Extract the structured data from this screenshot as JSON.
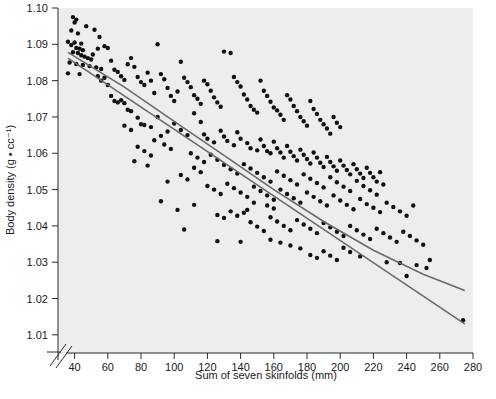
{
  "chart_data": {
    "type": "scatter",
    "title": "",
    "xlabel": "Sum of seven skinfolds (mm)",
    "ylabel": "Body density (g • cc⁻¹)",
    "xlim": [
      30,
      280
    ],
    "ylim": [
      1.005,
      1.1
    ],
    "xticks": [
      40,
      60,
      80,
      100,
      120,
      140,
      160,
      180,
      200,
      220,
      240,
      260,
      280
    ],
    "yticks": [
      1.01,
      1.02,
      1.03,
      1.04,
      1.05,
      1.06,
      1.07,
      1.08,
      1.09,
      1.1
    ],
    "ytick_labels": [
      "1.01",
      "1.02",
      "1.03",
      "1.04",
      "1.05",
      "1.06",
      "1.07",
      "1.08",
      "1.09",
      "1.10"
    ],
    "xtick_labels": [
      "40",
      "60",
      "80",
      "100",
      "120",
      "140",
      "160",
      "180",
      "200",
      "220",
      "240",
      "260",
      "280"
    ],
    "grid": false,
    "legend": "none",
    "axis_break": {
      "axis": "x",
      "position": "origin",
      "symbol": "double-slash"
    },
    "plot_background": "#ededed",
    "point_color": "#111111",
    "point_size": 3.2,
    "series": [
      {
        "name": "linear fit",
        "type": "line",
        "color": "#6a6a6a",
        "x": [
          36,
          275
        ],
        "y": [
          1.0862,
          1.013
        ]
      },
      {
        "name": "quadratic fit",
        "type": "curve",
        "color": "#6a6a6a",
        "x": [
          36,
          70,
          100,
          130,
          160,
          190,
          220,
          250,
          275
        ],
        "y": [
          1.0878,
          1.0782,
          1.0688,
          1.0594,
          1.05,
          1.0412,
          1.0333,
          1.0267,
          1.0222
        ]
      }
    ],
    "points": [
      [
        39,
        1.0975
      ],
      [
        41,
        1.0968
      ],
      [
        40,
        1.096
      ],
      [
        38,
        1.0938
      ],
      [
        42,
        1.093
      ],
      [
        36,
        1.0907
      ],
      [
        40,
        1.0905
      ],
      [
        44,
        1.0902
      ],
      [
        47,
        1.095
      ],
      [
        52,
        1.094
      ],
      [
        55,
        1.092
      ],
      [
        58,
        1.0895
      ],
      [
        38,
        1.0898
      ],
      [
        41,
        1.089
      ],
      [
        43,
        1.0888
      ],
      [
        45,
        1.0884
      ],
      [
        39,
        1.0878
      ],
      [
        42,
        1.0876
      ],
      [
        44,
        1.087
      ],
      [
        46,
        1.0866
      ],
      [
        48,
        1.0862
      ],
      [
        50,
        1.0858
      ],
      [
        37,
        1.085
      ],
      [
        41,
        1.0846
      ],
      [
        45,
        1.0843
      ],
      [
        49,
        1.084
      ],
      [
        53,
        1.0836
      ],
      [
        56,
        1.0832
      ],
      [
        36,
        1.082
      ],
      [
        43,
        1.0818
      ],
      [
        51,
        1.0872
      ],
      [
        54,
        1.0888
      ],
      [
        60,
        1.089
      ],
      [
        62,
        1.0855
      ],
      [
        64,
        1.083
      ],
      [
        66,
        1.0824
      ],
      [
        68,
        1.0812
      ],
      [
        70,
        1.0802
      ],
      [
        72,
        1.0845
      ],
      [
        74,
        1.0862
      ],
      [
        76,
        1.0838
      ],
      [
        78,
        1.081
      ],
      [
        80,
        1.0796
      ],
      [
        82,
        1.0788
      ],
      [
        84,
        1.0822
      ],
      [
        86,
        1.08
      ],
      [
        88,
        1.0766
      ],
      [
        90,
        1.09
      ],
      [
        92,
        1.0818
      ],
      [
        94,
        1.0804
      ],
      [
        96,
        1.078
      ],
      [
        98,
        1.0758
      ],
      [
        100,
        1.0744
      ],
      [
        102,
        1.077
      ],
      [
        104,
        1.0852
      ],
      [
        106,
        1.0808
      ],
      [
        108,
        1.0796
      ],
      [
        110,
        1.0782
      ],
      [
        112,
        1.076
      ],
      [
        114,
        1.075
      ],
      [
        116,
        1.0736
      ],
      [
        118,
        1.08
      ],
      [
        120,
        1.079
      ],
      [
        122,
        1.0772
      ],
      [
        124,
        1.0754
      ],
      [
        126,
        1.074
      ],
      [
        128,
        1.0728
      ],
      [
        130,
        1.088
      ],
      [
        134,
        1.0876
      ],
      [
        136,
        1.081
      ],
      [
        138,
        1.0796
      ],
      [
        140,
        1.0784
      ],
      [
        142,
        1.0762
      ],
      [
        144,
        1.0748
      ],
      [
        146,
        1.073
      ],
      [
        148,
        1.072
      ],
      [
        150,
        1.0712
      ],
      [
        152,
        1.08
      ],
      [
        154,
        1.0772
      ],
      [
        156,
        1.0758
      ],
      [
        158,
        1.0742
      ],
      [
        160,
        1.0726
      ],
      [
        162,
        1.0718
      ],
      [
        164,
        1.0706
      ],
      [
        166,
        1.0692
      ],
      [
        168,
        1.076
      ],
      [
        170,
        1.0748
      ],
      [
        172,
        1.073
      ],
      [
        174,
        1.0716
      ],
      [
        176,
        1.07
      ],
      [
        178,
        1.0688
      ],
      [
        180,
        1.0676
      ],
      [
        182,
        1.0744
      ],
      [
        184,
        1.0722
      ],
      [
        186,
        1.0708
      ],
      [
        188,
        1.0692
      ],
      [
        190,
        1.068
      ],
      [
        192,
        1.0668
      ],
      [
        194,
        1.0654
      ],
      [
        196,
        1.07
      ],
      [
        198,
        1.0684
      ],
      [
        200,
        1.0672
      ],
      [
        64,
        1.0744
      ],
      [
        66,
        1.074
      ],
      [
        70,
        1.0738
      ],
      [
        72,
        1.072
      ],
      [
        74,
        1.0716
      ],
      [
        78,
        1.0698
      ],
      [
        80,
        1.068
      ],
      [
        82,
        1.0678
      ],
      [
        86,
        1.0672
      ],
      [
        90,
        1.07
      ],
      [
        92,
        1.0648
      ],
      [
        96,
        1.066
      ],
      [
        100,
        1.0682
      ],
      [
        104,
        1.0664
      ],
      [
        108,
        1.065
      ],
      [
        112,
        1.071
      ],
      [
        116,
        1.0686
      ],
      [
        118,
        1.0652
      ],
      [
        120,
        1.064
      ],
      [
        124,
        1.063
      ],
      [
        128,
        1.0662
      ],
      [
        130,
        1.0646
      ],
      [
        132,
        1.0634
      ],
      [
        136,
        1.0622
      ],
      [
        138,
        1.0658
      ],
      [
        140,
        1.064
      ],
      [
        144,
        1.0628
      ],
      [
        146,
        1.0614
      ],
      [
        150,
        1.0608
      ],
      [
        152,
        1.0638
      ],
      [
        154,
        1.062
      ],
      [
        156,
        1.0606
      ],
      [
        158,
        1.06
      ],
      [
        160,
        1.0632
      ],
      [
        162,
        1.0614
      ],
      [
        164,
        1.0602
      ],
      [
        166,
        1.0588
      ],
      [
        168,
        1.062
      ],
      [
        170,
        1.0604
      ],
      [
        172,
        1.0592
      ],
      [
        174,
        1.058
      ],
      [
        176,
        1.061
      ],
      [
        178,
        1.0596
      ],
      [
        180,
        1.0584
      ],
      [
        182,
        1.0572
      ],
      [
        184,
        1.0602
      ],
      [
        186,
        1.0588
      ],
      [
        188,
        1.0574
      ],
      [
        190,
        1.0562
      ],
      [
        192,
        1.059
      ],
      [
        194,
        1.0576
      ],
      [
        196,
        1.0564
      ],
      [
        198,
        1.0552
      ],
      [
        200,
        1.058
      ],
      [
        202,
        1.0566
      ],
      [
        204,
        1.0554
      ],
      [
        206,
        1.0542
      ],
      [
        208,
        1.057
      ],
      [
        210,
        1.0556
      ],
      [
        212,
        1.0544
      ],
      [
        214,
        1.0532
      ],
      [
        216,
        1.056
      ],
      [
        218,
        1.0546
      ],
      [
        220,
        1.0534
      ],
      [
        222,
        1.0522
      ],
      [
        224,
        1.0548
      ],
      [
        110,
        1.06
      ],
      [
        114,
        1.0588
      ],
      [
        118,
        1.0576
      ],
      [
        122,
        1.0596
      ],
      [
        126,
        1.0582
      ],
      [
        130,
        1.0568
      ],
      [
        134,
        1.0556
      ],
      [
        138,
        1.0544
      ],
      [
        142,
        1.057
      ],
      [
        146,
        1.0558
      ],
      [
        150,
        1.0546
      ],
      [
        154,
        1.0534
      ],
      [
        158,
        1.0522
      ],
      [
        162,
        1.055
      ],
      [
        166,
        1.0538
      ],
      [
        170,
        1.0526
      ],
      [
        174,
        1.0514
      ],
      [
        178,
        1.0542
      ],
      [
        182,
        1.053
      ],
      [
        186,
        1.0518
      ],
      [
        190,
        1.0506
      ],
      [
        194,
        1.0534
      ],
      [
        198,
        1.052
      ],
      [
        202,
        1.0508
      ],
      [
        206,
        1.0496
      ],
      [
        210,
        1.0524
      ],
      [
        214,
        1.051
      ],
      [
        218,
        1.0498
      ],
      [
        222,
        1.0486
      ],
      [
        226,
        1.0514
      ],
      [
        104,
        1.054
      ],
      [
        108,
        1.0528
      ],
      [
        112,
        1.056
      ],
      [
        116,
        1.0548
      ],
      [
        120,
        1.051
      ],
      [
        124,
        1.05
      ],
      [
        128,
        1.0488
      ],
      [
        132,
        1.0516
      ],
      [
        136,
        1.0504
      ],
      [
        140,
        1.0492
      ],
      [
        144,
        1.048
      ],
      [
        148,
        1.0508
      ],
      [
        152,
        1.0496
      ],
      [
        156,
        1.0484
      ],
      [
        160,
        1.0472
      ],
      [
        164,
        1.05
      ],
      [
        168,
        1.0488
      ],
      [
        172,
        1.0476
      ],
      [
        176,
        1.0464
      ],
      [
        180,
        1.0492
      ],
      [
        184,
        1.048
      ],
      [
        188,
        1.0468
      ],
      [
        192,
        1.0456
      ],
      [
        196,
        1.0484
      ],
      [
        200,
        1.047
      ],
      [
        204,
        1.0458
      ],
      [
        208,
        1.0446
      ],
      [
        212,
        1.0474
      ],
      [
        216,
        1.046
      ],
      [
        220,
        1.045
      ],
      [
        224,
        1.0438
      ],
      [
        228,
        1.0464
      ],
      [
        232,
        1.0452
      ],
      [
        236,
        1.044
      ],
      [
        240,
        1.0428
      ],
      [
        244,
        1.0456
      ],
      [
        106,
        1.039
      ],
      [
        92,
        1.0468
      ],
      [
        112,
        1.0458
      ],
      [
        126,
        1.043
      ],
      [
        130,
        1.0422
      ],
      [
        134,
        1.044
      ],
      [
        126,
        1.0358
      ],
      [
        140,
        1.0356
      ],
      [
        146,
        1.041
      ],
      [
        150,
        1.0398
      ],
      [
        154,
        1.0386
      ],
      [
        158,
        1.0424
      ],
      [
        162,
        1.0412
      ],
      [
        166,
        1.04
      ],
      [
        170,
        1.0388
      ],
      [
        174,
        1.0416
      ],
      [
        178,
        1.0404
      ],
      [
        182,
        1.0392
      ],
      [
        186,
        1.038
      ],
      [
        190,
        1.0408
      ],
      [
        194,
        1.0396
      ],
      [
        198,
        1.0384
      ],
      [
        202,
        1.0372
      ],
      [
        206,
        1.04
      ],
      [
        210,
        1.0388
      ],
      [
        214,
        1.0376
      ],
      [
        218,
        1.0364
      ],
      [
        222,
        1.0392
      ],
      [
        226,
        1.038
      ],
      [
        230,
        1.0368
      ],
      [
        234,
        1.0356
      ],
      [
        238,
        1.0384
      ],
      [
        242,
        1.0372
      ],
      [
        246,
        1.036
      ],
      [
        250,
        1.0348
      ],
      [
        254,
        1.0306
      ],
      [
        182,
        1.032
      ],
      [
        186,
        1.0312
      ],
      [
        190,
        1.033
      ],
      [
        194,
        1.0318
      ],
      [
        198,
        1.0306
      ],
      [
        202,
        1.034
      ],
      [
        206,
        1.0328
      ],
      [
        212,
        1.0316
      ],
      [
        176,
        1.0338
      ],
      [
        170,
        1.0346
      ],
      [
        164,
        1.0354
      ],
      [
        158,
        1.0362
      ],
      [
        228,
        1.03
      ],
      [
        236,
        1.0298
      ],
      [
        246,
        1.0292
      ],
      [
        252,
        1.0284
      ],
      [
        240,
        1.0262
      ],
      [
        274,
        1.014
      ],
      [
        160,
        1.0448
      ],
      [
        156,
        1.0456
      ],
      [
        148,
        1.0464
      ],
      [
        144,
        1.0444
      ],
      [
        142,
        1.0436
      ],
      [
        138,
        1.0428
      ],
      [
        78,
        1.0618
      ],
      [
        82,
        1.0606
      ],
      [
        86,
        1.0594
      ],
      [
        88,
        1.0636
      ],
      [
        94,
        1.0624
      ],
      [
        98,
        1.0612
      ],
      [
        70,
        1.0676
      ],
      [
        74,
        1.0664
      ],
      [
        60,
        1.0788
      ],
      [
        58,
        1.0808
      ],
      [
        56,
        1.08
      ],
      [
        54,
        1.0812
      ],
      [
        62,
        1.0758
      ],
      [
        68,
        1.0746
      ],
      [
        76,
        1.0578
      ],
      [
        84,
        1.0566
      ],
      [
        102,
        1.0444
      ],
      [
        96,
        1.0522
      ]
    ]
  },
  "caption": {
    "text": ""
  }
}
